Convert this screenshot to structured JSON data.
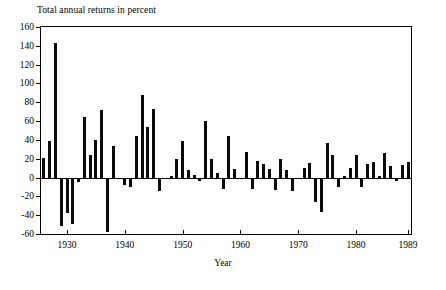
{
  "chart_data": {
    "type": "bar",
    "title": "Total annual returns in percent",
    "xlabel": "Year",
    "ylabel": "",
    "ylim": [
      -60,
      160
    ],
    "xlim": [
      1925.5,
      1989.5
    ],
    "ytick_labels": [
      "160",
      "140",
      "120",
      "100",
      "80",
      "60",
      "40",
      "20",
      "0",
      "-20",
      "-40",
      "-60"
    ],
    "yticks": [
      160,
      140,
      120,
      100,
      80,
      60,
      40,
      20,
      0,
      -20,
      -40,
      -60
    ],
    "xtick_labels": [
      "1930",
      "1940",
      "1950",
      "1960",
      "1970",
      "1980",
      "1989"
    ],
    "xticks": [
      1930,
      1940,
      1950,
      1960,
      1970,
      1980,
      1989
    ],
    "grid": false,
    "legend": null,
    "bar_color": "#0a0a0a",
    "categories": [
      1926,
      1927,
      1928,
      1929,
      1930,
      1931,
      1932,
      1933,
      1934,
      1935,
      1936,
      1937,
      1938,
      1939,
      1940,
      1941,
      1942,
      1943,
      1944,
      1945,
      1946,
      1947,
      1948,
      1949,
      1950,
      1951,
      1952,
      1953,
      1954,
      1955,
      1956,
      1957,
      1958,
      1959,
      1960,
      1961,
      1962,
      1963,
      1964,
      1965,
      1966,
      1967,
      1968,
      1969,
      1970,
      1971,
      1972,
      1973,
      1974,
      1975,
      1976,
      1977,
      1978,
      1979,
      1980,
      1981,
      1982,
      1983,
      1984,
      1985,
      1986,
      1987,
      1988,
      1989
    ],
    "values": [
      21,
      39,
      143,
      -51,
      -38,
      -49,
      -5,
      64,
      24,
      40,
      72,
      -58,
      33,
      -2,
      -8,
      -10,
      44,
      88,
      54,
      73,
      -14,
      -1,
      2,
      20,
      39,
      8,
      3,
      -4,
      60,
      20,
      5,
      -12,
      44,
      9,
      -1,
      27,
      -12,
      18,
      14,
      9,
      -13,
      20,
      8,
      -14,
      -1,
      10,
      15,
      -26,
      -37,
      37,
      24,
      -10,
      2,
      10,
      24,
      -10,
      14,
      17,
      2,
      26,
      12,
      -4,
      13,
      16
    ]
  }
}
